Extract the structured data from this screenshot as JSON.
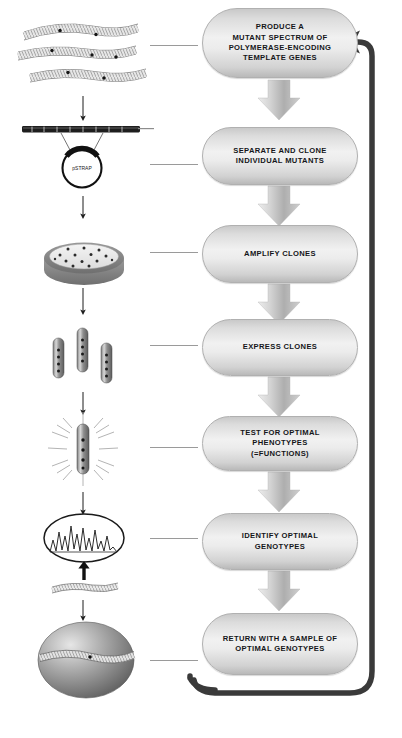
{
  "diagram": {
    "type": "cyclic-process-flowchart",
    "orientation": "vertical",
    "loop": "feedback from final step back to first step",
    "colors": {
      "box_fill_light": "#f1f1f1",
      "box_fill_dark": "#b9b9b9",
      "box_border": "#b0b0b0",
      "arrow": "#bdbdbd",
      "loop_arrow": "#3a3a3a",
      "connector_line": "#9a9a9a",
      "text": "#15161a",
      "background": "#ffffff"
    }
  },
  "steps": [
    {
      "id": "produce-mutant-spectrum",
      "lines": [
        "PRODUCE A",
        "MUTANT SPECTRUM OF",
        "POLYMERASE-ENCODING",
        "TEMPLATE GENES"
      ],
      "illustration": "mutated-dna-strands"
    },
    {
      "id": "separate-and-clone",
      "lines": [
        "SEPARATE AND CLONE",
        "INDIVIDUAL MUTANTS"
      ],
      "illustration": "plasmid-vector"
    },
    {
      "id": "amplify-clones",
      "lines": [
        "AMPLIFY CLONES"
      ],
      "illustration": "petri-dish-colonies"
    },
    {
      "id": "express-clones",
      "lines": [
        "EXPRESS CLONES"
      ],
      "illustration": "culture-tubes"
    },
    {
      "id": "test-optimal-phenotypes",
      "lines": [
        "TEST FOR OPTIMAL PHENOTYPES",
        "(=FUNCTIONS)"
      ],
      "illustration": "signal-burst-tube"
    },
    {
      "id": "identify-optimal-genotypes",
      "lines": [
        "IDENTIFY OPTIMAL GENOTYPES"
      ],
      "illustration": "sequencing-chromatogram"
    },
    {
      "id": "return-sample",
      "lines": [
        "RETURN WITH A SAMPLE OF",
        "OPTIMAL GENOTYPES"
      ],
      "illustration": "dna-bearing-sphere"
    }
  ],
  "labels": {
    "plasmid_name": "pSTRAP"
  }
}
